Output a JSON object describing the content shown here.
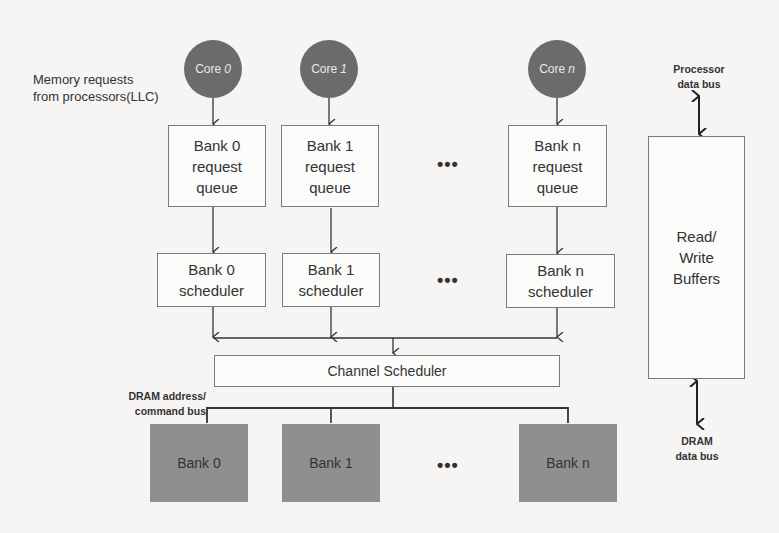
{
  "diagram": {
    "title_label": "Memory requests from processors(LLC)",
    "title_lines": [
      "Memory requests",
      "from processors(LLC)"
    ],
    "cores": [
      {
        "prefix": "Core",
        "index": "0"
      },
      {
        "prefix": "Core",
        "index": "1"
      },
      {
        "prefix": "Core",
        "index": "n"
      }
    ],
    "request_queues": [
      {
        "lines": [
          "Bank 0",
          "request",
          "queue"
        ]
      },
      {
        "lines": [
          "Bank 1",
          "request",
          "queue"
        ]
      },
      {
        "lines": [
          "Bank n",
          "request",
          "queue"
        ]
      }
    ],
    "bank_schedulers": [
      {
        "lines": [
          "Bank 0",
          "scheduler"
        ]
      },
      {
        "lines": [
          "Bank 1",
          "scheduler"
        ]
      },
      {
        "lines": [
          "Bank n",
          "scheduler"
        ]
      }
    ],
    "ellipsis": "•••",
    "channel_scheduler": "Channel Scheduler",
    "address_bus_label": [
      "DRAM address/",
      "command bus"
    ],
    "dram_banks": [
      "Bank 0",
      "Bank 1",
      "Bank n"
    ],
    "buffers": [
      "Read/",
      "Write",
      "Buffers"
    ],
    "processor_bus_label": [
      "Processor",
      "data bus"
    ],
    "dram_data_bus_label": [
      "DRAM",
      "data bus"
    ],
    "colors": {
      "core_fill": "#6b6b6b",
      "dram_bank_fill": "#8f8f8f",
      "box_border": "#7a7a7a",
      "background": "#f6f5f3"
    }
  }
}
